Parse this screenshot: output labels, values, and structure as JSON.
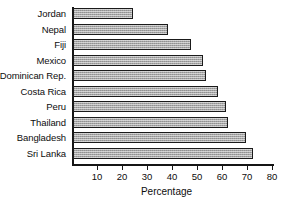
{
  "chart_data": {
    "type": "bar",
    "orientation": "horizontal",
    "title": "",
    "xlabel": "Percentage",
    "ylabel": "",
    "categories": [
      "Jordan",
      "Nepal",
      "Fiji",
      "Mexico",
      "Dominican Rep.",
      "Costa Rica",
      "Peru",
      "Thailand",
      "Bangladesh",
      "Sri Lanka"
    ],
    "values": [
      24,
      38,
      47,
      52,
      53,
      58,
      61,
      62,
      69,
      72
    ],
    "xlim": [
      0,
      80
    ],
    "xticks": [
      10,
      20,
      30,
      40,
      50,
      60,
      70,
      80
    ],
    "xtick_labels": [
      "10",
      "20",
      "30",
      "40",
      "50",
      "60",
      "70",
      "80"
    ],
    "grid": false,
    "legend": null,
    "bar_fill_color": "#a6a6a6",
    "bar_edge_color": "#1a1a1a",
    "axis_color": "#151515",
    "background_color": "#ffffff"
  }
}
